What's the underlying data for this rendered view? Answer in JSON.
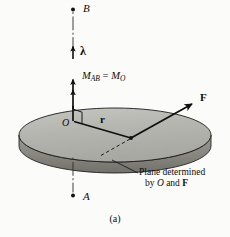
{
  "figure": {
    "caption": "(a)",
    "background_color": "#fbfbf9",
    "labels": {
      "point_b": "B",
      "point_a": "A",
      "unit_vector": "λ",
      "moment_M": "M",
      "moment_sub_AB": "AB",
      "moment_equals": " = ",
      "moment_M2": "M",
      "moment_sub_O": "O",
      "origin": "O",
      "position_vector": "r",
      "force_vector": "F",
      "plane_note_line1": "Plane determined",
      "plane_note_line2_prefix": "by ",
      "plane_note_O": "O",
      "plane_note_and": " and ",
      "plane_note_F": "F"
    },
    "colors": {
      "disk_top": "#b3b3ae",
      "disk_top_highlight": "#c3c3be",
      "disk_edge": "#8e8e88",
      "disk_edge_dark": "#6f6f6a",
      "outline": "#1a1a1a",
      "ink": "#0d0d0d",
      "axis": "#2b2b2b"
    },
    "geometry": {
      "axis_x": 73,
      "point_b_y": 9,
      "point_a_y": 196,
      "disk_center_x": 115,
      "disk_center_y": 135,
      "disk_rx": 96,
      "disk_ry": 27,
      "disk_thickness": 11,
      "origin_x": 76,
      "origin_y": 121,
      "r_tip_x": 131,
      "r_tip_y": 138,
      "force_tip_x": 193,
      "force_tip_y": 103
    }
  }
}
